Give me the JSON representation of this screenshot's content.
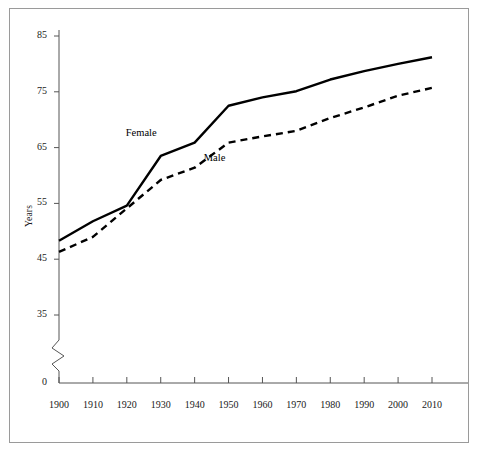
{
  "chart_data": {
    "type": "line",
    "title": "",
    "subtitle": "",
    "xlabel": "",
    "ylabel": "Years",
    "x": [
      1900,
      1910,
      1920,
      1930,
      1940,
      1950,
      1960,
      1970,
      1980,
      1990,
      2000,
      2010
    ],
    "xlim": [
      1900,
      2010
    ],
    "ylim": [
      0,
      85
    ],
    "y_axis_break": true,
    "y_break_between": [
      0,
      35
    ],
    "yticks": [
      85,
      75,
      65,
      55,
      45,
      35,
      0
    ],
    "xticks": [
      "1900",
      "1910",
      "1920",
      "1930",
      "1940",
      "1950",
      "1960",
      "1970",
      "1980",
      "1990",
      "2000",
      "2010"
    ],
    "grid": false,
    "legend_position": "inline-annotation",
    "series": [
      {
        "name": "Female",
        "style": "solid",
        "color": "#000000",
        "values": [
          48.3,
          51.8,
          54.6,
          63.5,
          65.9,
          72.5,
          74.0,
          75.1,
          77.2,
          78.7,
          80.0,
          81.2
        ]
      },
      {
        "name": "Male",
        "style": "dashed",
        "color": "#000000",
        "values": [
          46.3,
          49.0,
          54.1,
          59.2,
          61.4,
          65.9,
          67.0,
          68.0,
          70.3,
          72.2,
          74.3,
          75.7
        ]
      }
    ],
    "annotations": [
      {
        "text": "Female",
        "x": 1925,
        "y": 67.5
      },
      {
        "text": "Male",
        "x": 1948,
        "y": 63.0
      }
    ]
  }
}
